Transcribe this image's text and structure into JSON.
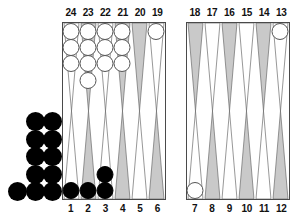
{
  "app": {
    "title": "Backgammon Board Position"
  },
  "board": {
    "colors": {
      "point_light": "#ffffff",
      "point_dark": "#c9c9c9",
      "point_outline": "#6b6b6b",
      "board_border": "#4a4a4a",
      "white_checker": "#ffffff",
      "white_checker_outline": "#555555",
      "black_checker": "#000000",
      "background": "#ffffff"
    },
    "quadrants": {
      "top_left_label": "white-home-outer-opponent",
      "top_right_label": "outer-board-top-right",
      "bottom_left_label": "home-board-bottom-left",
      "bottom_right_label": "outer-board-bottom-right"
    },
    "numbers": {
      "top_left": [
        "24",
        "23",
        "22",
        "21",
        "20",
        "19"
      ],
      "top_right": [
        "18",
        "17",
        "16",
        "15",
        "14",
        "13"
      ],
      "bottom_left": [
        "1",
        "2",
        "3",
        "4",
        "5",
        "6"
      ],
      "bottom_right": [
        "7",
        "8",
        "9",
        "10",
        "11",
        "12"
      ]
    },
    "points": [
      {
        "number": "24",
        "row": "top",
        "half": "left",
        "index": 0,
        "shade": "light",
        "checkers": 3,
        "color": "white"
      },
      {
        "number": "23",
        "row": "top",
        "half": "left",
        "index": 1,
        "shade": "dark",
        "checkers": 4,
        "color": "white"
      },
      {
        "number": "22",
        "row": "top",
        "half": "left",
        "index": 2,
        "shade": "light",
        "checkers": 3,
        "color": "white"
      },
      {
        "number": "21",
        "row": "top",
        "half": "left",
        "index": 3,
        "shade": "dark",
        "checkers": 3,
        "color": "white"
      },
      {
        "number": "20",
        "row": "top",
        "half": "left",
        "index": 4,
        "shade": "dark",
        "checkers": 0,
        "color": "none"
      },
      {
        "number": "19",
        "row": "top",
        "half": "left",
        "index": 5,
        "shade": "light",
        "checkers": 1,
        "color": "white"
      },
      {
        "number": "18",
        "row": "top",
        "half": "right",
        "index": 0,
        "shade": "dark",
        "checkers": 0,
        "color": "none"
      },
      {
        "number": "17",
        "row": "top",
        "half": "right",
        "index": 1,
        "shade": "light",
        "checkers": 0,
        "color": "none"
      },
      {
        "number": "16",
        "row": "top",
        "half": "right",
        "index": 2,
        "shade": "dark",
        "checkers": 0,
        "color": "none"
      },
      {
        "number": "15",
        "row": "top",
        "half": "right",
        "index": 3,
        "shade": "light",
        "checkers": 0,
        "color": "none"
      },
      {
        "number": "14",
        "row": "top",
        "half": "right",
        "index": 4,
        "shade": "dark",
        "checkers": 0,
        "color": "none"
      },
      {
        "number": "13",
        "row": "top",
        "half": "right",
        "index": 5,
        "shade": "light",
        "checkers": 1,
        "color": "white"
      },
      {
        "number": "1",
        "row": "bottom",
        "half": "left",
        "index": 0,
        "shade": "light",
        "checkers": 1,
        "color": "black"
      },
      {
        "number": "2",
        "row": "bottom",
        "half": "left",
        "index": 1,
        "shade": "dark",
        "checkers": 1,
        "color": "black"
      },
      {
        "number": "3",
        "row": "bottom",
        "half": "left",
        "index": 2,
        "shade": "light",
        "checkers": 2,
        "color": "black"
      },
      {
        "number": "4",
        "row": "bottom",
        "half": "left",
        "index": 3,
        "shade": "dark",
        "checkers": 0,
        "color": "none"
      },
      {
        "number": "5",
        "row": "bottom",
        "half": "left",
        "index": 4,
        "shade": "light",
        "checkers": 0,
        "color": "none"
      },
      {
        "number": "6",
        "row": "bottom",
        "half": "left",
        "index": 5,
        "shade": "dark",
        "checkers": 0,
        "color": "none"
      },
      {
        "number": "7",
        "row": "bottom",
        "half": "right",
        "index": 0,
        "shade": "light",
        "checkers": 1,
        "color": "white"
      },
      {
        "number": "8",
        "row": "bottom",
        "half": "right",
        "index": 1,
        "shade": "dark",
        "checkers": 0,
        "color": "none"
      },
      {
        "number": "9",
        "row": "bottom",
        "half": "right",
        "index": 2,
        "shade": "light",
        "checkers": 0,
        "color": "none"
      },
      {
        "number": "10",
        "row": "bottom",
        "half": "right",
        "index": 3,
        "shade": "dark",
        "checkers": 0,
        "color": "none"
      },
      {
        "number": "11",
        "row": "bottom",
        "half": "right",
        "index": 4,
        "shade": "light",
        "checkers": 0,
        "color": "none"
      },
      {
        "number": "12",
        "row": "bottom",
        "half": "right",
        "index": 5,
        "shade": "dark",
        "checkers": 0,
        "color": "none"
      }
    ],
    "bearoff_tray": {
      "color": "black",
      "count": 11,
      "layout": [
        {
          "col": 1,
          "rowi": 0
        },
        {
          "col": 2,
          "rowi": 0
        },
        {
          "col": 1,
          "rowi": 1
        },
        {
          "col": 2,
          "rowi": 1
        },
        {
          "col": 1,
          "rowi": 2
        },
        {
          "col": 2,
          "rowi": 2
        },
        {
          "col": 1,
          "rowi": 3
        },
        {
          "col": 2,
          "rowi": 3
        },
        {
          "col": 0,
          "rowi": 4
        },
        {
          "col": 1,
          "rowi": 4
        },
        {
          "col": 2,
          "rowi": 4
        }
      ]
    },
    "totals": {
      "white_on_board": 16,
      "black_on_board": 4,
      "black_borne_off": 11
    }
  }
}
